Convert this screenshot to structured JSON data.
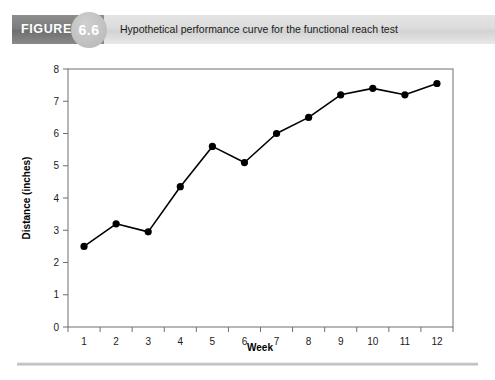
{
  "figure": {
    "badge_label": "FIGURE",
    "number": "6.6",
    "caption": "Hypothetical performance curve for the functional reach test"
  },
  "chart_data": {
    "type": "line",
    "title": "Hypothetical performance curve for the functional reach test",
    "xlabel": "Week",
    "ylabel": "Distance (inches)",
    "categories": [
      "1",
      "2",
      "3",
      "4",
      "5",
      "6",
      "7",
      "8",
      "9",
      "10",
      "11",
      "12"
    ],
    "x": [
      1,
      2,
      3,
      4,
      5,
      6,
      7,
      8,
      9,
      10,
      11,
      12
    ],
    "values": [
      2.5,
      3.2,
      2.95,
      4.35,
      5.6,
      5.1,
      6.0,
      6.5,
      7.2,
      7.4,
      7.2,
      7.55
    ],
    "xlim": [
      0.5,
      12.5
    ],
    "ylim": [
      0,
      8
    ],
    "y_ticks": [
      "0",
      "1",
      "2",
      "3",
      "4",
      "5",
      "6",
      "7",
      "8"
    ],
    "grid": false,
    "legend": null,
    "marker": "circle",
    "line_color": "#000000",
    "marker_color": "#000000"
  }
}
